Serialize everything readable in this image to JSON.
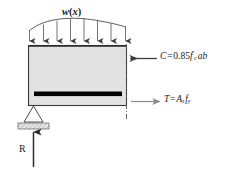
{
  "figure": {
    "background_color": "#ffffff",
    "beam_fill_color": "#e2e2e2",
    "beam_outline_color": "#3a3a3a",
    "rebar_color": "#000000",
    "arrow_color": "#3d3d3d",
    "tension_arrow_color": "#8a8a8a",
    "cut_line_color": "#555555"
  },
  "labels": {
    "distributed_load": "w(x)",
    "compression_force": "C = 0.85f′c ab",
    "tension_force": "T = As fy",
    "reaction": "R"
  },
  "load": {
    "arrow_count": 8,
    "direction": "down",
    "profile": "curved-arch"
  },
  "support": {
    "type": "pinned-triangular",
    "has_bearing_plate": true
  },
  "forces": [
    {
      "symbol": "C",
      "direction": "left",
      "location": "top-of-section",
      "expression": "0.85f′c ab"
    },
    {
      "symbol": "T",
      "direction": "right",
      "location": "rebar-level",
      "expression": "As fy"
    },
    {
      "symbol": "R",
      "direction": "up",
      "location": "left-support",
      "expression": ""
    },
    {
      "symbol": "w(x)",
      "direction": "down",
      "location": "top-of-beam",
      "expression": ""
    }
  ]
}
